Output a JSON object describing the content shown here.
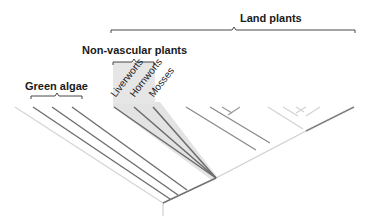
{
  "diagram": {
    "type": "phylogenetic-tree",
    "groups": {
      "land_plants": "Land plants",
      "non_vascular": "Non-vascular plants",
      "green_algae": "Green algae"
    },
    "taxa": {
      "liverworts": "Liverworts",
      "hornworts": "Hornworts",
      "mosses": "Mosses"
    },
    "colors": {
      "branch_dark": "#6e6e6e",
      "branch_light": "#d4d4d4",
      "highlight_fill": "#e2e2e2",
      "bracket": "#333333",
      "text": "#1a1a1a"
    }
  }
}
